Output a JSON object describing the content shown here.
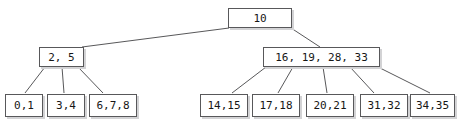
{
  "diagram": {
    "kind": "b-tree",
    "title": "",
    "background_color": "#ffffff",
    "node_border_color": "#58585a",
    "node_fill_color": "#ffffff",
    "node_shadow_color": "#d3d3d5",
    "edge_color": "#58585a",
    "text_color": "#161616",
    "nodes": [
      {
        "id": "root",
        "label": "10",
        "x": 228,
        "y": 8,
        "w": 64,
        "h": 20,
        "level": "root"
      },
      {
        "id": "int-left",
        "label": "2, 5",
        "x": 39,
        "y": 47,
        "w": 45,
        "h": 20,
        "level": "internal"
      },
      {
        "id": "int-right",
        "label": "16, 19, 28, 33",
        "x": 263,
        "y": 47,
        "w": 117,
        "h": 20,
        "level": "internal"
      },
      {
        "id": "leaf-1",
        "label": "0,1",
        "x": 5,
        "y": 94,
        "w": 38,
        "h": 23,
        "level": "leaf"
      },
      {
        "id": "leaf-2",
        "label": "3,4",
        "x": 47,
        "y": 94,
        "w": 38,
        "h": 23,
        "level": "leaf"
      },
      {
        "id": "leaf-3",
        "label": "6,7,8",
        "x": 89,
        "y": 94,
        "w": 48,
        "h": 23,
        "level": "leaf"
      },
      {
        "id": "leaf-4",
        "label": "14,15",
        "x": 200,
        "y": 94,
        "w": 48,
        "h": 23,
        "level": "leaf"
      },
      {
        "id": "leaf-5",
        "label": "17,18",
        "x": 252,
        "y": 94,
        "w": 48,
        "h": 23,
        "level": "leaf"
      },
      {
        "id": "leaf-6",
        "label": "20,21",
        "x": 306,
        "y": 94,
        "w": 48,
        "h": 23,
        "level": "leaf"
      },
      {
        "id": "leaf-7",
        "label": "31,32",
        "x": 360,
        "y": 94,
        "w": 48,
        "h": 23,
        "level": "leaf"
      },
      {
        "id": "leaf-8",
        "label": "34,35",
        "x": 410,
        "y": 94,
        "w": 45,
        "h": 23,
        "level": "leaf"
      }
    ],
    "edges": [
      {
        "from": "root",
        "to": "int-left",
        "x1": 229,
        "y1": 28,
        "x2": 82,
        "y2": 47
      },
      {
        "from": "root",
        "to": "int-right",
        "x1": 291,
        "y1": 28,
        "x2": 320,
        "y2": 47
      },
      {
        "from": "int-left",
        "to": "leaf-1",
        "x1": 45,
        "y1": 67,
        "x2": 25,
        "y2": 93
      },
      {
        "from": "int-left",
        "to": "leaf-2",
        "x1": 62,
        "y1": 67,
        "x2": 64,
        "y2": 93
      },
      {
        "from": "int-left",
        "to": "leaf-3",
        "x1": 78,
        "y1": 67,
        "x2": 103,
        "y2": 93
      },
      {
        "from": "int-right",
        "to": "leaf-4",
        "x1": 266,
        "y1": 67,
        "x2": 232,
        "y2": 93
      },
      {
        "from": "int-right",
        "to": "leaf-5",
        "x1": 293,
        "y1": 67,
        "x2": 278,
        "y2": 93
      },
      {
        "from": "int-right",
        "to": "leaf-6",
        "x1": 323,
        "y1": 67,
        "x2": 327,
        "y2": 93
      },
      {
        "from": "int-right",
        "to": "leaf-7",
        "x1": 350,
        "y1": 67,
        "x2": 374,
        "y2": 93
      },
      {
        "from": "int-right",
        "to": "leaf-8",
        "x1": 378,
        "y1": 67,
        "x2": 430,
        "y2": 93
      }
    ]
  }
}
